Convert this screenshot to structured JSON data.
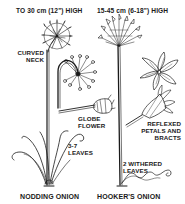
{
  "diagram": {
    "plants": [
      {
        "name": "NODDING ONION",
        "height_label": "TO 30 cm (12\") HIGH",
        "annotations": {
          "neck": [
            "CURVED",
            "NECK"
          ],
          "flower": [
            "GLOBE",
            "FLOWER"
          ],
          "leaves": [
            "3-7",
            "LEAVES"
          ]
        }
      },
      {
        "name": "HOOKER'S ONION",
        "height_label": "15-45 cm (6-18\") HIGH",
        "annotations": {
          "flower": [
            "REFLEXED",
            "PETALS AND",
            "BRACTS"
          ],
          "leaves": [
            "2 WITHERED",
            "LEAVES"
          ]
        }
      }
    ],
    "colors": {
      "ink": "#1a1a1a",
      "background": "#ffffff"
    }
  }
}
